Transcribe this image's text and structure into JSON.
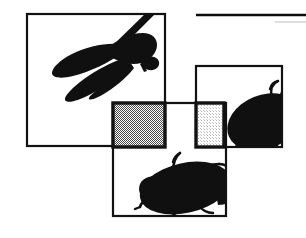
{
  "figure": {
    "background_color": "#ffffff",
    "width": 306,
    "height": 238,
    "style": "black-and-white line art with dithered gray fills",
    "alt_text": "Three overlapping bordered white panels containing black insect silhouettes, a dragonfly at upper left and beetles at right and bottom, with two dithered gray squares at the panel intersections and a horizontal rule at the upper right."
  },
  "colors": {
    "ink": "#101010",
    "border": "#121212",
    "panel_fill": "#ffffff",
    "gray_square_dark": "#8c8c8c",
    "gray_square_light": "#e3e3e3",
    "rule_dark": "#0d0d0d",
    "rule_light": "#c8c8c8",
    "page": "#ffffff"
  },
  "panels": [
    {
      "name": "dragonfly-panel",
      "label": "Dragonfly panel",
      "x": 27,
      "y": 14,
      "width": 138,
      "height": 132,
      "border_width": 2.2,
      "subject": "dragonfly-silhouette"
    },
    {
      "name": "right-beetle-panel",
      "label": "Right beetle panel",
      "x": 196,
      "y": 66,
      "width": 86,
      "height": 81,
      "border_width": 2.2,
      "subject": "beetle-silhouette-right"
    },
    {
      "name": "bottom-beetle-panel",
      "label": "Bottom beetle panel",
      "x": 113,
      "y": 103,
      "width": 113,
      "height": 113,
      "border_width": 2.2,
      "subject": "beetle-silhouette-bottom"
    }
  ],
  "gray_squares": [
    {
      "name": "dark-gray-square",
      "label": "Dark dithered square",
      "x": 113,
      "y": 103,
      "width": 52,
      "height": 44,
      "fill": "#8c8c8c",
      "border_width": 3.4
    },
    {
      "name": "light-gray-square",
      "label": "Light dithered square",
      "x": 196,
      "y": 103,
      "width": 28,
      "height": 44,
      "fill": "#e3e3e3",
      "border_width": 3.4
    }
  ],
  "rules": [
    {
      "name": "top-rule-dark",
      "label": "Upper heavy rule",
      "x1": 196,
      "y1": 15,
      "x2": 306,
      "y2": 15,
      "thickness": 2.6,
      "color": "#0d0d0d"
    },
    {
      "name": "top-rule-light",
      "label": "Upper light rule",
      "x1": 275,
      "y1": 22,
      "x2": 306,
      "y2": 22,
      "thickness": 1.2,
      "color": "#c8c8c8"
    }
  ],
  "subjects": [
    {
      "name": "dragonfly-silhouette",
      "label": "Dragonfly silhouette",
      "panel": "dragonfly-panel",
      "description": "Black dragonfly in flight, wings swept to lower left, body angled from upper left to right, tail extending past the panel top edge"
    },
    {
      "name": "beetle-silhouette-right",
      "label": "Right beetle silhouette",
      "panel": "right-beetle-panel",
      "description": "Black beetle body cropped by panel edge, antennae curving upward, legs angled down and to the right"
    },
    {
      "name": "beetle-silhouette-bottom",
      "label": "Bottom beetle silhouette",
      "panel": "bottom-beetle-panel",
      "description": "Black beetle in three-quarter view, elongated oval body, two antennae raised, legs descending to the lower left"
    }
  ]
}
